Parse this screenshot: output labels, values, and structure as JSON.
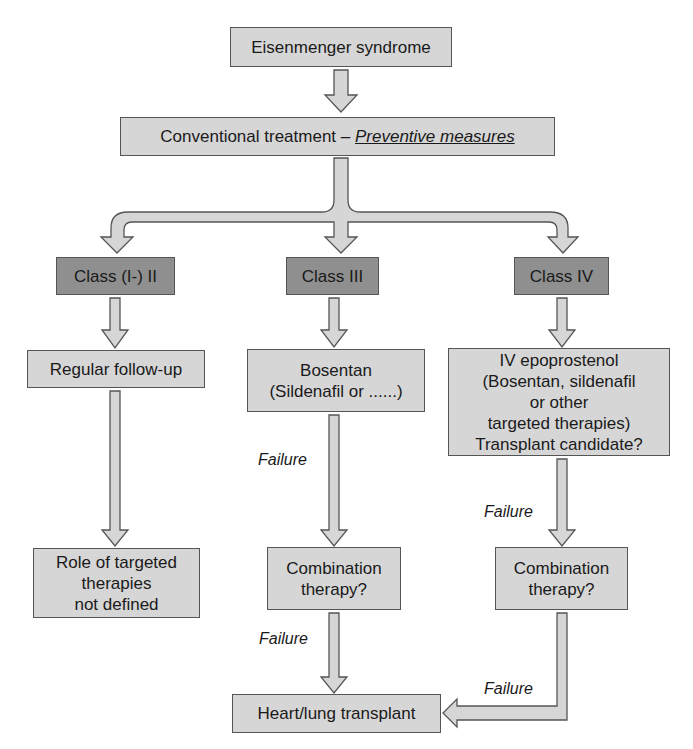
{
  "diagram": {
    "type": "flowchart",
    "colors": {
      "box_fill": "#d6d6d6",
      "class_box_fill": "#8f8f8f",
      "border": "#555555",
      "arrow_fill": "#d6d6d6"
    },
    "nodes": {
      "root": {
        "text": "Eisenmenger syndrome"
      },
      "conventional": {
        "text": "Conventional treatment – ",
        "emphasis": "Preventive measures"
      },
      "class_2": {
        "text": "Class (I-) II"
      },
      "class_3": {
        "text": "Class III"
      },
      "class_4": {
        "text": "Class IV"
      },
      "regular_followup": {
        "text": "Regular follow-up"
      },
      "role_targeted": {
        "lines": [
          "Role of targeted",
          "therapies",
          "not defined"
        ]
      },
      "bosentan": {
        "lines": [
          "Bosentan",
          "(Sildenafil or ......)"
        ]
      },
      "combination_mid": {
        "lines": [
          "Combination",
          "therapy?"
        ]
      },
      "epoprostenol": {
        "lines": [
          "IV epoprostenol",
          "(Bosentan, sildenafil",
          "or other",
          "targeted therapies)",
          "Transplant candidate?"
        ]
      },
      "combination_right": {
        "lines": [
          "Combination",
          "therapy?"
        ]
      },
      "heart_lung": {
        "text": "Heart/lung transplant"
      }
    },
    "edge_labels": {
      "bosentan_to_combination": "Failure",
      "combination_to_transplant": "Failure",
      "epoprostenol_to_combination": "Failure",
      "combination_right_to_transplant": "Failure"
    },
    "edges": [
      [
        "root",
        "conventional"
      ],
      [
        "conventional",
        "class_2"
      ],
      [
        "conventional",
        "class_3"
      ],
      [
        "conventional",
        "class_4"
      ],
      [
        "class_2",
        "regular_followup"
      ],
      [
        "regular_followup",
        "role_targeted"
      ],
      [
        "class_3",
        "bosentan"
      ],
      [
        "bosentan",
        "combination_mid",
        "Failure"
      ],
      [
        "combination_mid",
        "heart_lung",
        "Failure"
      ],
      [
        "class_4",
        "epoprostenol"
      ],
      [
        "epoprostenol",
        "combination_right",
        "Failure"
      ],
      [
        "combination_right",
        "heart_lung",
        "Failure"
      ]
    ]
  }
}
